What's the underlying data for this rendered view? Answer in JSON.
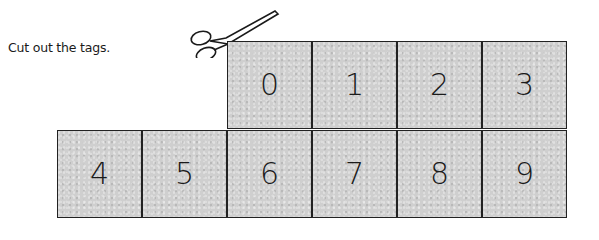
{
  "instruction": "Cut out the tags.",
  "icons": {
    "scissors": "scissors-icon"
  },
  "tags": {
    "top_row": [
      "0",
      "1",
      "2",
      "3"
    ],
    "bottom_row": [
      "4",
      "5",
      "6",
      "7",
      "8",
      "9"
    ]
  },
  "colors": {
    "tag_fill": "#cfcfcf",
    "border": "#222222",
    "text": "#1a1a1a"
  }
}
